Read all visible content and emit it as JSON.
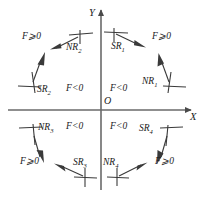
{
  "diagram": {
    "type": "engineering-schematic",
    "axes": {
      "x_label": "X",
      "y_label": "Y",
      "origin_label": "O"
    },
    "region_labels": {
      "outer_top_left": "F⩾0",
      "outer_top_right": "F⩾0",
      "outer_bottom_left": "F⩾0",
      "outer_bottom_right": "F⩾0",
      "inner_quadrant_2": "F<0",
      "inner_quadrant_1": "F<0",
      "inner_quadrant_3": "F<0",
      "inner_quadrant_4": "F<0"
    },
    "markers": [
      {
        "id": "NR2",
        "base": "NR",
        "sub": "2"
      },
      {
        "id": "SR1",
        "base": "SR",
        "sub": "1"
      },
      {
        "id": "NR1",
        "base": "NR",
        "sub": "1"
      },
      {
        "id": "SR4",
        "base": "SR",
        "sub": "4"
      },
      {
        "id": "NR4",
        "base": "NR",
        "sub": "4"
      },
      {
        "id": "SR3",
        "base": "SR",
        "sub": "3"
      },
      {
        "id": "NR3",
        "base": "NR",
        "sub": "3"
      },
      {
        "id": "SR2",
        "base": "SR",
        "sub": "2"
      }
    ],
    "colors": {
      "line": "#4a4a4a",
      "ink": "#1a1a1a",
      "background": "#ffffff"
    }
  }
}
